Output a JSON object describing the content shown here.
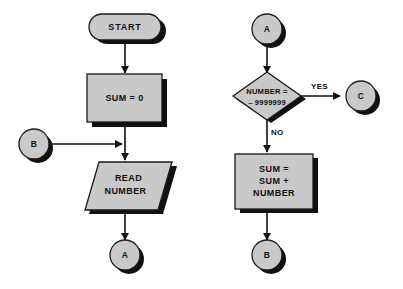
{
  "diagram": {
    "type": "flowchart",
    "background_color": "#ffffff",
    "shape_fill_color": "#c9c9c9",
    "shape_stroke_color": "#1a1a1a",
    "shadow_color": "#101010",
    "connector_color": "#111111",
    "left_column": {
      "start": {
        "label": "START",
        "shape": "terminator"
      },
      "init": {
        "label": "SUM = 0",
        "shape": "process"
      },
      "entry_connector": {
        "label": "B",
        "shape": "connector"
      },
      "read": {
        "line1": "READ",
        "line2": "NUMBER",
        "shape": "input-output"
      },
      "exit_connector": {
        "label": "A",
        "shape": "connector"
      }
    },
    "right_column": {
      "entry_connector": {
        "label": "A",
        "shape": "connector"
      },
      "decision": {
        "line1": "NUMBER =",
        "line2": "– 9999999",
        "shape": "decision"
      },
      "yes_label": "YES",
      "no_label": "NO",
      "yes_connector": {
        "label": "C",
        "shape": "connector"
      },
      "accumulate": {
        "line1": "SUM =",
        "line2": "SUM +",
        "line3": "NUMBER",
        "shape": "process"
      },
      "exit_connector": {
        "label": "B",
        "shape": "connector"
      }
    }
  }
}
